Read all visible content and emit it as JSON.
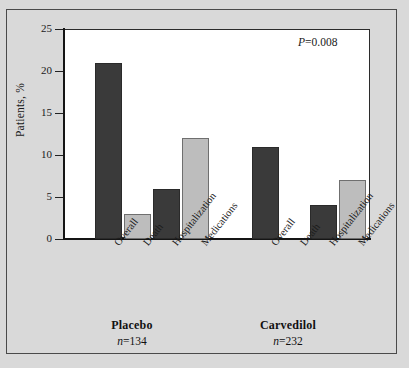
{
  "figure": {
    "background_color": "#d9d9d9",
    "plot_background_color": "#ffffff",
    "axis_color": "#151515"
  },
  "annotation": {
    "p_italic": "P",
    "p_rest": "=0.008"
  },
  "axis": {
    "y_title": "Patients, %",
    "y_ticks": [
      "25",
      "20",
      "15",
      "10",
      "5",
      "0"
    ]
  },
  "groups": [
    {
      "name": "Placebo",
      "n_italic": "n",
      "n_rest": "=134"
    },
    {
      "name": "Carvedilol",
      "n_italic": "n",
      "n_rest": "=232"
    }
  ],
  "categories": [
    "Overall",
    "Death",
    "Hospitalization",
    "Medications"
  ],
  "chart_data": {
    "type": "bar",
    "title": "",
    "subtitle": "",
    "xlabel": "",
    "ylabel": "Patients, %",
    "ylim": [
      0,
      25
    ],
    "yticks": [
      0,
      5,
      10,
      15,
      20,
      25
    ],
    "grid": false,
    "legend": "none",
    "annotations": [
      "P=0.008"
    ],
    "group_labels": [
      "Placebo",
      "Carvedilol"
    ],
    "group_sublabels": [
      "n=134",
      "n=232"
    ],
    "categories": [
      "Overall",
      "Death",
      "Hospitalization",
      "Medications"
    ],
    "series": [
      {
        "name": "Placebo",
        "values": [
          21,
          3,
          6,
          12
        ]
      },
      {
        "name": "Carvedilol",
        "values": [
          11,
          0,
          4,
          7
        ]
      }
    ],
    "bar_colors": {
      "Overall": "#3a3a3a",
      "Death": "#bdbdbd",
      "Hospitalization": "#3a3a3a",
      "Medications": "#bdbdbd"
    }
  }
}
